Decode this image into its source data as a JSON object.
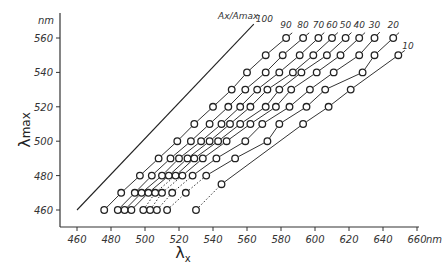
{
  "chart_data": {
    "type": "scatter",
    "title": "",
    "xlabel": "λx",
    "ylabel": "λmax",
    "x_unit": "nm",
    "y_unit": "nm",
    "xlim": [
      460,
      660
    ],
    "ylim": [
      460,
      560
    ],
    "x_ticks": [
      460,
      480,
      500,
      520,
      540,
      560,
      580,
      600,
      620,
      640,
      660
    ],
    "y_ticks": [
      460,
      480,
      500,
      520,
      540,
      560
    ],
    "grid": false,
    "legend_title": "Ax/Amax",
    "reference_line": {
      "label": "100",
      "points": [
        [
          460,
          460
        ],
        [
          564,
          568
        ]
      ]
    },
    "series": [
      {
        "name": "90",
        "points": [
          [
            476,
            460
          ],
          [
            486,
            470
          ],
          [
            497,
            480
          ],
          [
            508,
            490
          ],
          [
            519,
            500
          ],
          [
            529,
            510
          ],
          [
            540,
            520
          ],
          [
            551,
            530
          ],
          [
            560,
            540
          ],
          [
            571,
            550
          ],
          [
            583,
            560
          ]
        ]
      },
      {
        "name": "80",
        "points": [
          [
            484,
            460
          ],
          [
            494,
            470
          ],
          [
            504,
            480
          ],
          [
            515,
            490
          ],
          [
            527,
            500
          ],
          [
            538,
            510
          ],
          [
            549,
            520
          ],
          [
            559,
            530
          ],
          [
            571,
            540
          ],
          [
            581,
            550
          ],
          [
            593,
            560
          ]
        ]
      },
      {
        "name": "70",
        "points": [
          [
            488,
            460
          ],
          [
            498,
            470
          ],
          [
            510,
            480
          ],
          [
            520,
            490
          ],
          [
            533,
            500
          ],
          [
            545,
            510
          ],
          [
            556,
            520
          ],
          [
            566,
            530
          ],
          [
            579,
            540
          ],
          [
            591,
            550
          ],
          [
            602,
            560
          ]
        ]
      },
      {
        "name": "60",
        "points": [
          [
            492,
            460
          ],
          [
            502,
            470
          ],
          [
            514,
            480
          ],
          [
            525,
            490
          ],
          [
            538,
            500
          ],
          [
            550,
            510
          ],
          [
            562,
            520
          ],
          [
            572,
            530
          ],
          [
            587,
            540
          ],
          [
            599,
            550
          ],
          [
            610,
            560
          ]
        ]
      },
      {
        "name": "50",
        "points": [
          [
            499,
            460
          ],
          [
            506,
            470
          ],
          [
            518,
            480
          ],
          [
            529,
            490
          ],
          [
            543,
            500
          ],
          [
            556,
            510
          ],
          [
            571,
            520
          ],
          [
            579,
            530
          ],
          [
            592,
            540
          ],
          [
            607,
            550
          ],
          [
            618,
            560
          ]
        ]
      },
      {
        "name": "40",
        "points": [
          [
            503,
            460
          ],
          [
            510,
            470
          ],
          [
            522,
            480
          ],
          [
            534,
            490
          ],
          [
            548,
            500
          ],
          [
            562,
            510
          ],
          [
            577,
            520
          ],
          [
            586,
            530
          ],
          [
            601,
            540
          ],
          [
            615,
            550
          ],
          [
            626,
            560
          ]
        ]
      },
      {
        "name": "30",
        "points": [
          [
            507,
            460
          ],
          [
            516,
            470
          ],
          [
            528,
            480
          ],
          [
            542,
            490
          ],
          [
            559,
            500
          ],
          [
            569,
            510
          ],
          [
            585,
            520
          ],
          [
            597,
            530
          ],
          [
            611,
            540
          ],
          [
            626,
            550
          ],
          [
            635,
            560
          ]
        ]
      },
      {
        "name": "20",
        "points": [
          [
            513,
            460
          ],
          [
            524,
            470
          ],
          [
            536,
            480
          ],
          [
            553,
            490
          ],
          [
            572,
            500
          ],
          [
            579,
            510
          ],
          [
            595,
            520
          ],
          [
            606,
            530
          ],
          [
            628,
            540
          ],
          [
            635,
            550
          ],
          [
            646,
            560
          ]
        ]
      },
      {
        "name": "10",
        "points": [
          [
            530,
            460
          ],
          [
            545,
            475
          ],
          [
            593,
            510
          ],
          [
            608,
            520
          ],
          [
            621,
            530
          ],
          [
            649,
            550
          ]
        ]
      }
    ]
  },
  "axes": {
    "x_unit_label": "nm",
    "y_unit_label": "nm",
    "x_title": "λ",
    "x_title_sub": "x",
    "y_title": "λ",
    "y_title_sub": "max",
    "legend_title": "Ax/Amax",
    "reference_label": "100"
  }
}
